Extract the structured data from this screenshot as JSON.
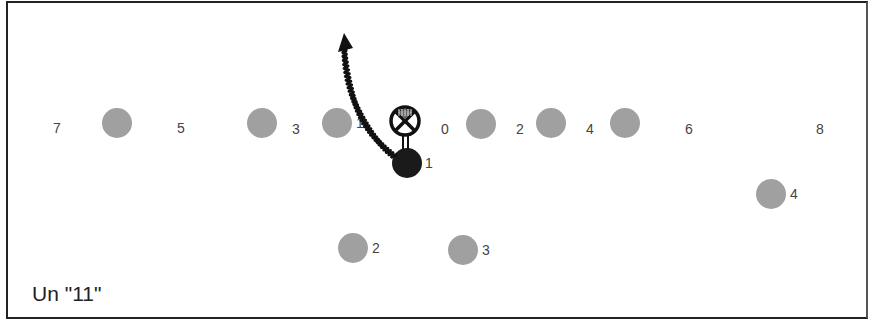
{
  "diagram": {
    "title": "Un \"11\"",
    "colors": {
      "player": "#a0a0a0",
      "ball_carrier": "#1a1a1a",
      "border": "#222222",
      "label": "#444444"
    },
    "gap_numbers": [
      {
        "label": "7",
        "x": 57,
        "y": 133
      },
      {
        "label": "5",
        "x": 181,
        "y": 133
      },
      {
        "label": "3",
        "x": 296,
        "y": 134
      },
      {
        "label": "0",
        "x": 445,
        "y": 134
      },
      {
        "label": "2",
        "x": 520,
        "y": 134
      },
      {
        "label": "4",
        "x": 590,
        "y": 134
      },
      {
        "label": "6",
        "x": 689,
        "y": 134
      },
      {
        "label": "8",
        "x": 820,
        "y": 134
      }
    ],
    "line_players": [
      {
        "x": 117,
        "y": 123,
        "label": ""
      },
      {
        "x": 262,
        "y": 123,
        "label": ""
      },
      {
        "x": 337,
        "y": 123,
        "label": "1"
      },
      {
        "x": 481,
        "y": 124,
        "label": ""
      },
      {
        "x": 551,
        "y": 123,
        "label": ""
      },
      {
        "x": 625,
        "y": 123,
        "label": ""
      }
    ],
    "backfield_players": [
      {
        "x": 353,
        "y": 248,
        "label": "2"
      },
      {
        "x": 463,
        "y": 250,
        "label": "3"
      },
      {
        "x": 771,
        "y": 194,
        "label": "4"
      }
    ],
    "center": {
      "symbol": "crossed-circle",
      "x": 405,
      "y": 121
    },
    "ball_carrier": {
      "x": 407,
      "y": 163,
      "label": "1"
    },
    "route": {
      "from": [
        395,
        157
      ],
      "to": [
        344,
        33
      ],
      "style": "wavy",
      "head": "arrow"
    }
  }
}
